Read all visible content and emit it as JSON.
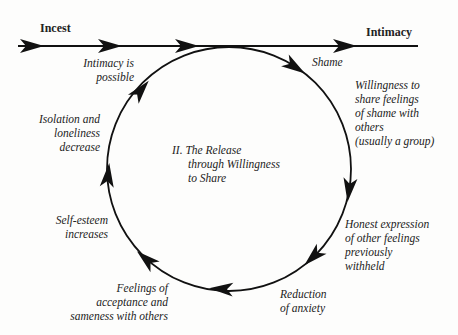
{
  "diagram": {
    "start_label": "Incest",
    "end_label": "Intimacy",
    "center_title": [
      "II. The Release",
      "through Willingness",
      "to Share"
    ],
    "cycle_steps": [
      {
        "id": "shame",
        "lines": [
          "Shame"
        ]
      },
      {
        "id": "willingness",
        "lines": [
          "Willingness to",
          "share feelings",
          "of shame with",
          "others",
          "(usually a group)"
        ]
      },
      {
        "id": "honest-expression",
        "lines": [
          "Honest expression",
          "of other feelings",
          "previously",
          "withheld"
        ]
      },
      {
        "id": "reduction-anxiety",
        "lines": [
          "Reduction",
          "of anxiety"
        ]
      },
      {
        "id": "acceptance",
        "lines": [
          "Feelings of",
          "acceptance and",
          "sameness with others"
        ]
      },
      {
        "id": "self-esteem",
        "lines": [
          "Self-esteem",
          "increases"
        ]
      },
      {
        "id": "isolation",
        "lines": [
          "Isolation and",
          "loneliness",
          "decrease"
        ]
      },
      {
        "id": "intimacy-possible",
        "lines": [
          "Intimacy is",
          "possible"
        ]
      }
    ],
    "colors": {
      "line": "#111111",
      "text": "#222222",
      "background": "#fdfdfc"
    }
  }
}
